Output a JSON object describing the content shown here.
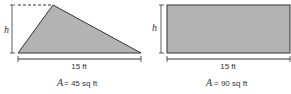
{
  "figures": [
    {
      "shape": "triangle",
      "height_label": "h",
      "base_label": "15 ft",
      "area_var": "A",
      "area_text": "= 45 sq ft"
    },
    {
      "shape": "rectangle",
      "height_label": "h",
      "base_label": "15 ft",
      "area_var": "A",
      "area_text": "= 90 sq ft"
    }
  ],
  "colors": {
    "fill": "#b3b3b3",
    "stroke": "#333333"
  }
}
